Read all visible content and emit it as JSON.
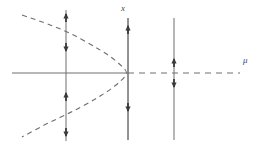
{
  "figure": {
    "width": 263,
    "height": 147,
    "background": "#ffffff",
    "stroke_color": "#6e6e6e",
    "dash_color": "#6e6e6e",
    "arrow_color": "#3a3a3a",
    "label_color": "#4a4a4a"
  },
  "labels": {
    "vertical_axis": "x",
    "horizontal_axis": "μ"
  },
  "chart_data": {
    "type": "line",
    "xlabel": "μ",
    "ylabel": "x",
    "grid": false,
    "legend": null,
    "origin_px": {
      "x": 128,
      "y": 73
    },
    "axes": {
      "horizontal": {
        "label": "μ",
        "x_start_px": 12,
        "x_end_px": 240,
        "y_px": 73,
        "solid_segment_px": [
          12,
          128
        ],
        "dashed_segment_px": [
          128,
          240
        ],
        "note": "solid (stable) for mu<0, dashed (unstable) for mu>0"
      },
      "vertical": {
        "label": "x",
        "x_px": 128,
        "y_start_px": 18,
        "y_end_px": 140,
        "style": "solid"
      }
    },
    "curves": [
      {
        "name": "parabola-branch",
        "style": "dashed",
        "stability": "unstable",
        "opens": "left",
        "vertex_px": {
          "x": 128,
          "y": 73
        },
        "points_px": [
          {
            "x": 22,
            "y": 15
          },
          {
            "x": 46,
            "y": 23
          },
          {
            "x": 70,
            "y": 33
          },
          {
            "x": 92,
            "y": 45
          },
          {
            "x": 110,
            "y": 56
          },
          {
            "x": 122,
            "y": 66
          },
          {
            "x": 128,
            "y": 73
          },
          {
            "x": 122,
            "y": 80
          },
          {
            "x": 110,
            "y": 90
          },
          {
            "x": 92,
            "y": 101
          },
          {
            "x": 70,
            "y": 113
          },
          {
            "x": 46,
            "y": 124
          },
          {
            "x": 22,
            "y": 137
          }
        ]
      }
    ],
    "phase_lines": [
      {
        "name": "phase-line-left",
        "x_px": 66,
        "y_top_px": 10,
        "y_bottom_px": 141,
        "regime": "mu < mu_c",
        "arrows": [
          {
            "y_px": 13,
            "direction": "up"
          },
          {
            "y_px": 52,
            "direction": "down"
          },
          {
            "y_px": 92,
            "direction": "up"
          },
          {
            "y_px": 137,
            "direction": "down"
          }
        ]
      },
      {
        "name": "phase-line-origin",
        "x_px": 128,
        "y_top_px": 18,
        "y_bottom_px": 140,
        "regime": "mu = 0",
        "arrows": [
          {
            "y_px": 25,
            "direction": "up"
          },
          {
            "y_px": 112,
            "direction": "down"
          }
        ]
      },
      {
        "name": "phase-line-right",
        "x_px": 174,
        "y_top_px": 18,
        "y_bottom_px": 140,
        "regime": "mu > 0",
        "arrows": [
          {
            "y_px": 58,
            "direction": "up"
          },
          {
            "y_px": 88,
            "direction": "down"
          }
        ]
      }
    ]
  }
}
